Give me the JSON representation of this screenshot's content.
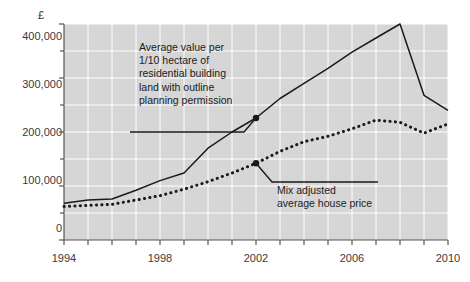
{
  "chart_data": {
    "type": "line",
    "title": "",
    "subtitle": "",
    "xlabel": "",
    "ylabel": "£",
    "ylabel_symbol": "£",
    "xlim": [
      1994,
      2010
    ],
    "ylim": [
      0,
      400000
    ],
    "grid": true,
    "grid_color": "#ffffff",
    "plot_background": "#d6d6d6",
    "axis_color": "#555555",
    "legend": "none (in-plot annotations with leader lines)",
    "y_ticks_major": [
      0,
      100000,
      200000,
      300000,
      400000
    ],
    "y_tick_labels": [
      "0",
      "100,000",
      "200,000",
      "300,000",
      "400,000"
    ],
    "y_ticks_minor": [
      50000,
      150000,
      250000,
      350000
    ],
    "x_ticks": [
      1994,
      1995,
      1996,
      1997,
      1998,
      1999,
      2000,
      2001,
      2002,
      2003,
      2004,
      2005,
      2006,
      2007,
      2008,
      2009,
      2010
    ],
    "x_tick_labels_shown": [
      "1994",
      "1998",
      "2002",
      "2006",
      "2010"
    ],
    "x_tick_labels_shown_at": [
      1994,
      1998,
      2002,
      2006,
      2010
    ],
    "x": [
      1994,
      1995,
      1996,
      1997,
      1998,
      1999,
      2000,
      2001,
      2002,
      2003,
      2004,
      2005,
      2006,
      2007,
      2008,
      2009,
      2010
    ],
    "series": [
      {
        "name": "Average value per 1/10 hectare of residential building land with outline planning permission",
        "style": "solid",
        "color": "#1a1a1a",
        "marker_years": [
          2002
        ],
        "values": [
          68000,
          74000,
          76000,
          92000,
          110000,
          124000,
          170000,
          200000,
          226000,
          262000,
          290000,
          318000,
          348000,
          374000,
          400000,
          268000,
          240000
        ]
      },
      {
        "name": "Mix adjusted average house price",
        "style": "dotted",
        "color": "#1a1a1a",
        "marker_years": [
          2002
        ],
        "values": [
          62000,
          64000,
          66000,
          74000,
          82000,
          94000,
          108000,
          124000,
          142000,
          164000,
          182000,
          192000,
          206000,
          222000,
          218000,
          198000,
          215000
        ]
      }
    ],
    "annotations": [
      {
        "id": "land-value-annotation",
        "text": "Average value per\n1/10 hectare of\nresidential building\nland with outline\nplanning permission",
        "points_to_series": "Average value per 1/10 hectare of residential building land with outline planning permission",
        "points_to_year": 2002,
        "points_to_value": 226000
      },
      {
        "id": "house-price-annotation",
        "text": "Mix adjusted\naverage house price",
        "points_to_series": "Mix adjusted average house price",
        "points_to_year": 2002,
        "points_to_value": 142000
      }
    ]
  },
  "annotations_text": {
    "land_value": "Average value per\n1/10 hectare of\nresidential building\nland with outline\nplanning permission",
    "house_price": "Mix adjusted\naverage house price"
  },
  "axis": {
    "y_label": "£",
    "y_tick_labels": [
      "400,000",
      "300,000",
      "200,000",
      "100,000",
      "0"
    ],
    "x_tick_labels": [
      "1994",
      "1998",
      "2002",
      "2006",
      "2010"
    ]
  }
}
